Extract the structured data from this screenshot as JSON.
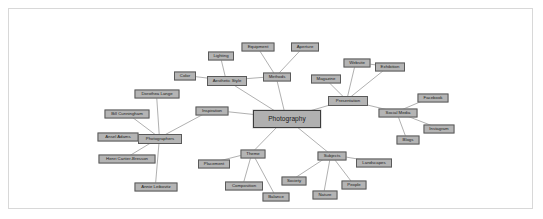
{
  "diagram": {
    "type": "mind-map",
    "title": "Photography",
    "style": {
      "node_fill": "#b4b4b4",
      "node_border": "#5a5a5a",
      "central_border": "#3c3c3c",
      "edge_color": "#8c8c8c",
      "frame_border": "#d8d8d8",
      "background": "#ffffff"
    },
    "central": {
      "id": "photography",
      "label": "Photography",
      "x": 278,
      "y": 110,
      "w": 68,
      "h": 18
    },
    "nodes": [
      {
        "id": "aesthetic_style",
        "label": "Aesthetic Style",
        "x": 218,
        "y": 72,
        "w": 40,
        "h": 10
      },
      {
        "id": "color",
        "label": "Color",
        "x": 176,
        "y": 67,
        "w": 22,
        "h": 9
      },
      {
        "id": "lighting",
        "label": "Lighting",
        "x": 212,
        "y": 47,
        "w": 26,
        "h": 9
      },
      {
        "id": "methods",
        "label": "Methods",
        "x": 268,
        "y": 68,
        "w": 28,
        "h": 9
      },
      {
        "id": "equipment",
        "label": "Equipment",
        "x": 249,
        "y": 38,
        "w": 33,
        "h": 9
      },
      {
        "id": "aperture",
        "label": "Aperture",
        "x": 296,
        "y": 38,
        "w": 28,
        "h": 9
      },
      {
        "id": "inspiration",
        "label": "Inspiration",
        "x": 203,
        "y": 102,
        "w": 33,
        "h": 9
      },
      {
        "id": "photographers",
        "label": "Photographers",
        "x": 151,
        "y": 130,
        "w": 44,
        "h": 10
      },
      {
        "id": "dorothea_lange",
        "label": "Dorothea Lange",
        "x": 148,
        "y": 85,
        "w": 45,
        "h": 9
      },
      {
        "id": "bill_cunningham",
        "label": "Bill Cunningham",
        "x": 118,
        "y": 105,
        "w": 45,
        "h": 9
      },
      {
        "id": "ansel_adams",
        "label": "Ansel Adams",
        "x": 109,
        "y": 128,
        "w": 41,
        "h": 9
      },
      {
        "id": "henri_cartier_bresson",
        "label": "Henri Cartier-Bresson",
        "x": 118,
        "y": 150,
        "w": 57,
        "h": 9
      },
      {
        "id": "annie_leibovitz",
        "label": "Annie Leibovitz",
        "x": 147,
        "y": 178,
        "w": 43,
        "h": 9
      },
      {
        "id": "presentation",
        "label": "Presentation",
        "x": 339,
        "y": 92,
        "w": 40,
        "h": 10
      },
      {
        "id": "magazine",
        "label": "Magazine",
        "x": 317,
        "y": 70,
        "w": 30,
        "h": 9
      },
      {
        "id": "website",
        "label": "Website",
        "x": 348,
        "y": 54,
        "w": 27,
        "h": 9
      },
      {
        "id": "exhibition",
        "label": "Exhibition",
        "x": 381,
        "y": 58,
        "w": 30,
        "h": 9
      },
      {
        "id": "social_media",
        "label": "Social Media",
        "x": 389,
        "y": 104,
        "w": 39,
        "h": 9
      },
      {
        "id": "facebook",
        "label": "Facebook",
        "x": 424,
        "y": 89,
        "w": 31,
        "h": 9
      },
      {
        "id": "instagram",
        "label": "Instagram",
        "x": 430,
        "y": 120,
        "w": 31,
        "h": 9
      },
      {
        "id": "blogs",
        "label": "Blogs",
        "x": 399,
        "y": 131,
        "w": 23,
        "h": 9
      },
      {
        "id": "subjects",
        "label": "Subjects",
        "x": 323,
        "y": 147,
        "w": 29,
        "h": 9
      },
      {
        "id": "landscapes",
        "label": "Landscapes",
        "x": 365,
        "y": 154,
        "w": 36,
        "h": 9
      },
      {
        "id": "people",
        "label": "People",
        "x": 345,
        "y": 176,
        "w": 25,
        "h": 9
      },
      {
        "id": "nature",
        "label": "Nature",
        "x": 316,
        "y": 186,
        "w": 25,
        "h": 9
      },
      {
        "id": "society",
        "label": "Society",
        "x": 285,
        "y": 172,
        "w": 25,
        "h": 9
      },
      {
        "id": "theme",
        "label": "Theme",
        "x": 244,
        "y": 145,
        "w": 25,
        "h": 9
      },
      {
        "id": "placement",
        "label": "Placement",
        "x": 205,
        "y": 155,
        "w": 32,
        "h": 9
      },
      {
        "id": "composition",
        "label": "Composition",
        "x": 235,
        "y": 177,
        "w": 38,
        "h": 9
      },
      {
        "id": "balance",
        "label": "Balance",
        "x": 267,
        "y": 188,
        "w": 27,
        "h": 9
      }
    ],
    "edges": [
      {
        "from": "photography",
        "to": "aesthetic_style"
      },
      {
        "from": "photography",
        "to": "methods"
      },
      {
        "from": "photography",
        "to": "inspiration"
      },
      {
        "from": "photography",
        "to": "presentation"
      },
      {
        "from": "photography",
        "to": "subjects"
      },
      {
        "from": "photography",
        "to": "theme"
      },
      {
        "from": "aesthetic_style",
        "to": "color"
      },
      {
        "from": "aesthetic_style",
        "to": "lighting"
      },
      {
        "from": "aesthetic_style",
        "to": "methods"
      },
      {
        "from": "methods",
        "to": "equipment"
      },
      {
        "from": "methods",
        "to": "aperture"
      },
      {
        "from": "inspiration",
        "to": "photographers"
      },
      {
        "from": "photographers",
        "to": "dorothea_lange"
      },
      {
        "from": "photographers",
        "to": "bill_cunningham"
      },
      {
        "from": "photographers",
        "to": "ansel_adams"
      },
      {
        "from": "photographers",
        "to": "henri_cartier_bresson"
      },
      {
        "from": "photographers",
        "to": "annie_leibovitz"
      },
      {
        "from": "presentation",
        "to": "magazine"
      },
      {
        "from": "presentation",
        "to": "website"
      },
      {
        "from": "presentation",
        "to": "exhibition"
      },
      {
        "from": "presentation",
        "to": "social_media"
      },
      {
        "from": "website",
        "to": "exhibition"
      },
      {
        "from": "social_media",
        "to": "facebook"
      },
      {
        "from": "social_media",
        "to": "instagram"
      },
      {
        "from": "social_media",
        "to": "blogs"
      },
      {
        "from": "subjects",
        "to": "landscapes"
      },
      {
        "from": "subjects",
        "to": "people"
      },
      {
        "from": "subjects",
        "to": "nature"
      },
      {
        "from": "subjects",
        "to": "society"
      },
      {
        "from": "theme",
        "to": "placement"
      },
      {
        "from": "theme",
        "to": "composition"
      },
      {
        "from": "theme",
        "to": "balance"
      }
    ]
  }
}
